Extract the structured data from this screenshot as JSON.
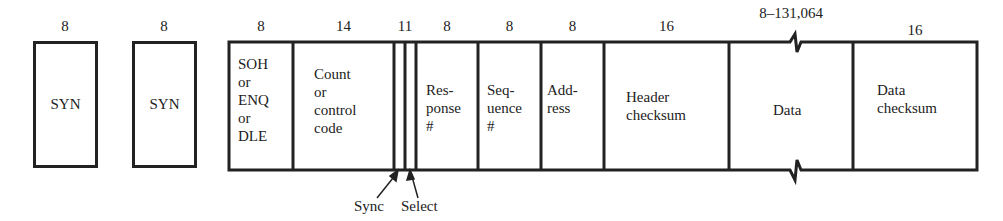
{
  "diagram": {
    "fields": [
      {
        "id": "syn1",
        "bits": "8",
        "label": "SYN"
      },
      {
        "id": "syn2",
        "bits": "8",
        "label": "SYN"
      },
      {
        "id": "start",
        "bits": "8",
        "label": "SOH\nor\nENQ\nor\nDLE"
      },
      {
        "id": "count",
        "bits": "14",
        "label": "Count\nor\ncontrol\ncode"
      },
      {
        "id": "flags",
        "bits": "11"
      },
      {
        "id": "response",
        "bits": "8",
        "label": "Res-\nponse\n#"
      },
      {
        "id": "sequence",
        "bits": "8",
        "label": "Seq-\nuence\n#"
      },
      {
        "id": "address",
        "bits": "8",
        "label": "Add-\nress"
      },
      {
        "id": "header_checksum",
        "bits": "16",
        "label": "Header\nchecksum"
      },
      {
        "id": "data",
        "bits": "8–131,064",
        "label": "Data"
      },
      {
        "id": "data_checksum",
        "bits": "16",
        "label": "Data\nchecksum"
      }
    ],
    "annotations": {
      "sync": "Sync",
      "select": "Select"
    }
  }
}
